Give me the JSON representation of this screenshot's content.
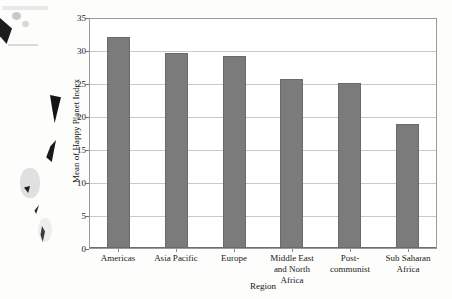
{
  "chart_data": {
    "type": "bar",
    "title": "",
    "xlabel": "Region",
    "ylabel": "Mean of Happy Planet Index",
    "categories": [
      "Americas",
      "Asia Pacific",
      "Europe",
      "Middle East and North Africa",
      "Post-communist",
      "Sub Saharan Africa"
    ],
    "values": [
      32.2,
      29.8,
      29.4,
      25.8,
      25.2,
      19.0
    ],
    "ylim": [
      0,
      35
    ],
    "ytick_labels": [
      "0",
      "5",
      "10",
      "15",
      "20",
      "25",
      "30",
      "35"
    ],
    "ytick_values": [
      0,
      5,
      10,
      15,
      20,
      25,
      30,
      35
    ],
    "grid": "horizontal",
    "legend": "none",
    "bar_color": "#7b7b7b",
    "bar_border_color": "#6a6a6a",
    "gridline_color": "#c9c9c9",
    "axis_color": "#6e6e6e",
    "background_color": "#ffffff"
  }
}
